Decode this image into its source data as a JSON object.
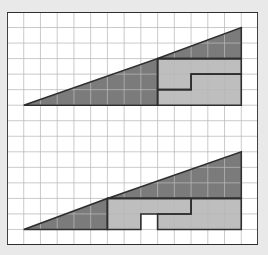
{
  "grid": {
    "cols": 15,
    "rows": 15
  },
  "colors": {
    "background": "#e9e9e9",
    "paper": "#ffffff",
    "grid_line": "#b8b8b8",
    "outline": "#2e2e2e",
    "dark_fill": "#7b7b7b",
    "light_fill": "#bebebe",
    "hole_fill": "#ffffff"
  },
  "figures": [
    {
      "name": "top-figure",
      "pieces": [
        {
          "name": "large-dark-triangle",
          "fill": "dark",
          "points": [
            [
              1,
              6
            ],
            [
              9,
              6
            ],
            [
              9,
              3
            ]
          ]
        },
        {
          "name": "small-dark-triangle",
          "fill": "dark",
          "points": [
            [
              9,
              3
            ],
            [
              14,
              3
            ],
            [
              14,
              1
            ]
          ]
        },
        {
          "name": "upper-light-l-piece",
          "fill": "light",
          "points": [
            [
              9,
              3
            ],
            [
              14,
              3
            ],
            [
              14,
              4
            ],
            [
              11,
              4
            ],
            [
              11,
              5
            ],
            [
              9,
              5
            ]
          ]
        },
        {
          "name": "lower-light-l-piece",
          "fill": "light",
          "points": [
            [
              9,
              5
            ],
            [
              11,
              5
            ],
            [
              11,
              4
            ],
            [
              14,
              4
            ],
            [
              14,
              6
            ],
            [
              9,
              6
            ]
          ]
        }
      ]
    },
    {
      "name": "bottom-figure",
      "pieces": [
        {
          "name": "small-dark-triangle",
          "fill": "dark",
          "points": [
            [
              1,
              14
            ],
            [
              6,
              14
            ],
            [
              6,
              12
            ]
          ]
        },
        {
          "name": "large-dark-triangle",
          "fill": "dark",
          "points": [
            [
              6,
              12
            ],
            [
              14,
              12
            ],
            [
              14,
              9
            ]
          ]
        },
        {
          "name": "left-light-l-piece",
          "fill": "light",
          "points": [
            [
              6,
              12
            ],
            [
              11,
              12
            ],
            [
              11,
              13
            ],
            [
              8,
              13
            ],
            [
              8,
              14
            ],
            [
              6,
              14
            ]
          ]
        },
        {
          "name": "right-light-l-piece",
          "fill": "light",
          "points": [
            [
              11,
              12
            ],
            [
              14,
              12
            ],
            [
              14,
              14
            ],
            [
              9,
              14
            ],
            [
              9,
              13
            ],
            [
              11,
              13
            ]
          ]
        },
        {
          "name": "missing-square-hole",
          "fill": "hole",
          "points": [
            [
              8,
              13
            ],
            [
              9,
              13
            ],
            [
              9,
              14
            ],
            [
              8,
              14
            ]
          ]
        }
      ]
    }
  ]
}
